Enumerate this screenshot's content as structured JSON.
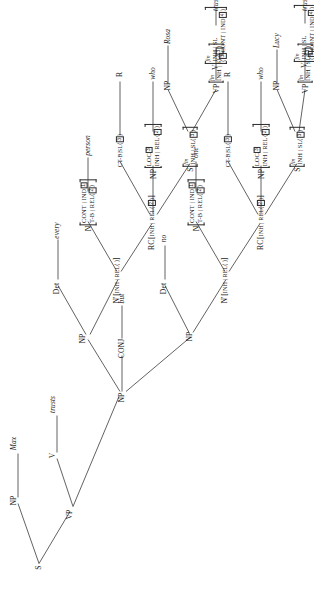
{
  "figure": {
    "type": "syntax-tree",
    "framework": "HPSG",
    "orientation": "rotated-90-ccw",
    "ink_color": "#2b2b2b"
  },
  "tags": {
    "t1": "1",
    "t2": "2",
    "t3": "3",
    "t4": "4"
  },
  "labels": {
    "s": "S",
    "np": "NP",
    "vp": "VP",
    "v": "V",
    "det": "Det",
    "conj": "CONJ",
    "n": "N",
    "nbar": "N'",
    "rc": "RC",
    "r": "R",
    "fin": "fin"
  },
  "features": {
    "inh_rel": "INH | REL",
    "inh_sl": "INH | SL",
    "t_b_rel": "T-B | REL",
    "ct_b_sl": "CT-B|SL",
    "cont_ind": "CONT | IND",
    "loc": "LOC",
    "empty_list": "⟨ ⟩",
    "open_angle": "⟨",
    "close_angle": "⟩",
    "cont_ind_inline": "CONT | IND"
  },
  "nodes": [
    {
      "id": "S",
      "kind": "category",
      "text": "S"
    },
    {
      "id": "NP-subj",
      "kind": "category",
      "text": "NP"
    },
    {
      "id": "Max",
      "kind": "leaf",
      "text": "Max"
    },
    {
      "id": "VP",
      "kind": "category",
      "text": "VP"
    },
    {
      "id": "V-main",
      "kind": "category",
      "text": "V"
    },
    {
      "id": "trusts-main",
      "kind": "leaf",
      "text": "trusts"
    },
    {
      "id": "NP-obj",
      "kind": "category",
      "text": "NP"
    },
    {
      "id": "NP-left",
      "kind": "category",
      "text": "NP"
    },
    {
      "id": "CONJ",
      "kind": "category",
      "text": "CONJ"
    },
    {
      "id": "but",
      "kind": "leaf",
      "text": "but"
    },
    {
      "id": "NP-right",
      "kind": "category",
      "text": "NP"
    },
    {
      "id": "Det-left",
      "kind": "category",
      "text": "Det"
    },
    {
      "id": "every",
      "kind": "leaf",
      "text": "every"
    },
    {
      "id": "Det-right",
      "kind": "category",
      "text": "Det"
    },
    {
      "id": "no",
      "kind": "leaf",
      "text": "no"
    },
    {
      "id": "person",
      "kind": "leaf",
      "text": "person"
    },
    {
      "id": "one",
      "kind": "leaf",
      "text": "one"
    },
    {
      "id": "R-left",
      "kind": "leaf",
      "text": "R"
    },
    {
      "id": "R-right",
      "kind": "leaf",
      "text": "R"
    },
    {
      "id": "who-left",
      "kind": "leaf",
      "text": "who"
    },
    {
      "id": "who-right",
      "kind": "leaf",
      "text": "who"
    },
    {
      "id": "Rosa",
      "kind": "leaf",
      "text": "Rosa"
    },
    {
      "id": "Lucy",
      "kind": "leaf",
      "text": "Lucy"
    },
    {
      "id": "trusts-left",
      "kind": "leaf",
      "text": "trusts"
    },
    {
      "id": "trusts-right",
      "kind": "leaf",
      "text": "trusts"
    }
  ],
  "leaf_words": {
    "max": "Max",
    "trusts_main": "trusts",
    "every": "every",
    "person": "person",
    "but": "but",
    "no": "no",
    "one": "one",
    "r_left": "R",
    "r_right": "R",
    "who_left": "who",
    "who_right": "who",
    "rosa": "Rosa",
    "lucy": "Lucy",
    "trusts_left": "trusts",
    "trusts_right": "trusts"
  }
}
